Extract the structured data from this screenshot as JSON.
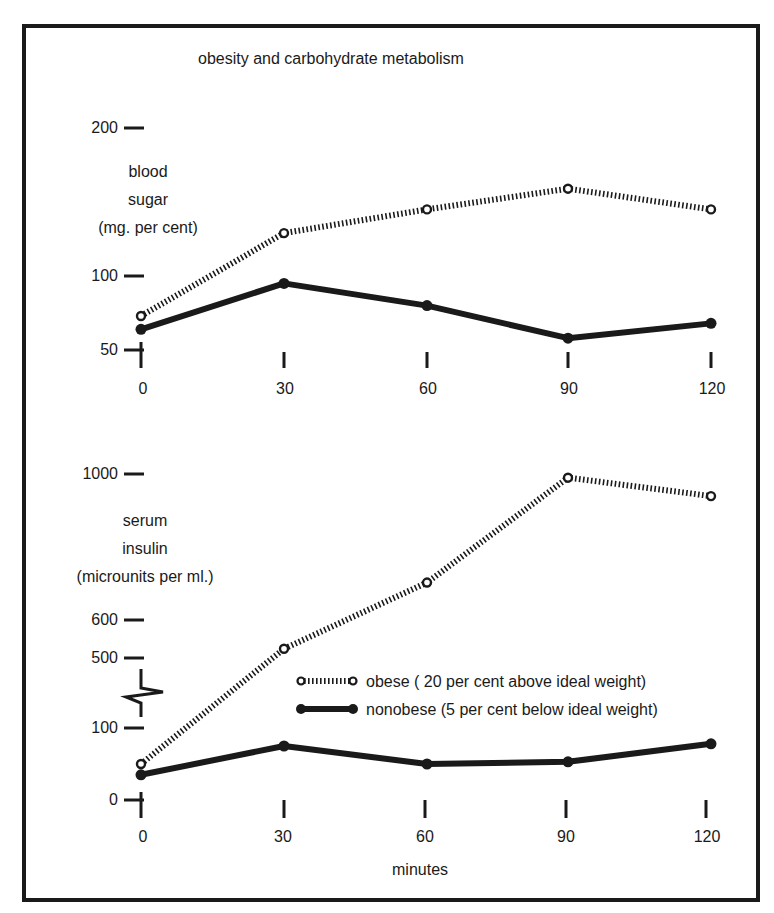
{
  "title": "obesity and carbohydrate metabolism",
  "top_panel": {
    "ylabel_lines": [
      "blood",
      "sugar",
      "(mg. per cent)"
    ],
    "yticks": [
      "200",
      "100",
      "50"
    ],
    "xticks": [
      "0",
      "30",
      "60",
      "90",
      "120"
    ]
  },
  "bottom_panel": {
    "ylabel_lines": [
      "serum",
      "insulin",
      "(microunits per ml.)"
    ],
    "yticks": [
      "1000",
      "600",
      "500",
      "100",
      "0"
    ],
    "xticks": [
      "0",
      "30",
      "60",
      "90",
      "120"
    ],
    "xlabel": "minutes"
  },
  "legend": {
    "obese": "obese ( 20 per cent above ideal weight)",
    "nonobese": "nonobese (5 per cent below ideal weight)"
  },
  "colors": {
    "ink": "#1a1a1a",
    "background": "#ffffff"
  },
  "chart_data": [
    {
      "type": "line",
      "title": "obesity and carbohydrate metabolism",
      "xlabel": "minutes",
      "ylabel": "blood sugar (mg. per cent)",
      "x": [
        0,
        30,
        60,
        90,
        120
      ],
      "yticks": [
        50,
        100,
        200
      ],
      "ylim": [
        50,
        200
      ],
      "grid": false,
      "series": [
        {
          "name": "obese (20 per cent above ideal weight)",
          "style": "dotted, open circles",
          "values": [
            73,
            129,
            145,
            159,
            145
          ]
        },
        {
          "name": "nonobese (5 per cent below ideal weight)",
          "style": "solid thick, filled circles",
          "values": [
            64,
            95,
            80,
            58,
            68
          ]
        }
      ]
    },
    {
      "type": "line",
      "xlabel": "minutes",
      "ylabel": "serum insulin (microunits per ml.)",
      "x": [
        0,
        30,
        60,
        90,
        120
      ],
      "yticks": [
        0,
        100,
        500,
        600,
        1000
      ],
      "ylim": [
        0,
        1000
      ],
      "axis_break": "between 100 and 500",
      "grid": false,
      "legend_position": "lower right, inside panel",
      "series": [
        {
          "name": "obese (20 per cent above ideal weight)",
          "style": "dotted, open circles",
          "values": [
            50,
            525,
            705,
            990,
            940
          ]
        },
        {
          "name": "nonobese (5 per cent below ideal weight)",
          "style": "solid thick, filled circles",
          "values": [
            35,
            75,
            50,
            53,
            78
          ]
        }
      ]
    }
  ]
}
